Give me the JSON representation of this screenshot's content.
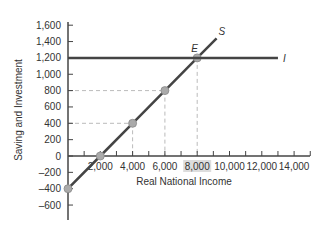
{
  "chart_data": {
    "type": "line",
    "title": "",
    "xlabel": "Real National Income",
    "ylabel": "Saving and Investment",
    "xlim": [
      0,
      14000
    ],
    "ylim": [
      -600,
      1600
    ],
    "x_ticks": [
      2000,
      4000,
      6000,
      8000,
      10000,
      12000,
      14000
    ],
    "x_tick_labels": [
      "2,000",
      "4,000",
      "6,000",
      "8,000",
      "10,000",
      "12,000",
      "14,000"
    ],
    "highlighted_x_tick": "8,000",
    "y_ticks": [
      1600,
      1400,
      1200,
      1000,
      800,
      600,
      400,
      200,
      0,
      -200,
      -400,
      -600
    ],
    "y_tick_labels": [
      "1,600",
      "1,400",
      "1,200",
      "1,000",
      "800",
      "600",
      "400",
      "200",
      "0",
      "–200",
      "–400",
      "–600"
    ],
    "grid": false,
    "series": [
      {
        "name": "S",
        "label": "S",
        "x": [
          0,
          2000,
          4000,
          6000,
          8000,
          9200
        ],
        "y": [
          -400,
          0,
          400,
          800,
          1200,
          1440
        ],
        "marked_points": [
          [
            0,
            -400
          ],
          [
            2000,
            0
          ],
          [
            4000,
            400
          ],
          [
            6000,
            800
          ],
          [
            8000,
            1200
          ]
        ]
      },
      {
        "name": "I",
        "label": "I",
        "x": [
          0,
          13000
        ],
        "y": [
          1200,
          1200
        ]
      }
    ],
    "annotations": [
      {
        "text": "E",
        "x": 8000,
        "y": 1200,
        "description": "Equilibrium where S = I"
      }
    ],
    "guide_lines": [
      {
        "from": [
          0,
          400
        ],
        "to": [
          4000,
          400
        ]
      },
      {
        "from": [
          4000,
          400
        ],
        "to": [
          4000,
          0
        ]
      },
      {
        "from": [
          0,
          800
        ],
        "to": [
          6000,
          800
        ]
      },
      {
        "from": [
          6000,
          800
        ],
        "to": [
          6000,
          0
        ]
      },
      {
        "from": [
          8000,
          1200
        ],
        "to": [
          8000,
          0
        ]
      }
    ],
    "colors": {
      "line": "#444444",
      "point": "#aaaaaa",
      "dashed": "#bbbbbb",
      "highlight_bg": "#dddddd"
    }
  }
}
